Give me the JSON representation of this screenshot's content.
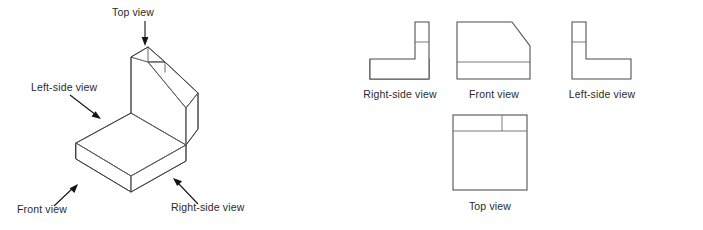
{
  "diagram": {
    "background_color": "#ffffff",
    "line_color": "#5a5a5a",
    "label_color": "#2a2a2a",
    "arrow_color": "#141414"
  },
  "isometric": {
    "caption_top": "Top view",
    "caption_left": "Left-side view",
    "caption_front": "Front view",
    "caption_right": "Right-side view",
    "object_description": "L-shaped bracket: horizontal base slab with an upright back plate whose upper right corner is chamfered"
  },
  "orthographic": {
    "views": [
      {
        "id": "right-side",
        "label": "Right-side view",
        "shape": "L-profile, upright leg at right, horizontal foot extending left, internal horizontal line near top of upright leg"
      },
      {
        "id": "front",
        "label": "Front view",
        "shape": "rectangle with chamfered upper-right corner and a horizontal line near the bottom"
      },
      {
        "id": "left-side",
        "label": "Left-side view",
        "shape": "mirrored L-profile, upright leg at left, horizontal foot extending right, internal horizontal line near top of upright leg"
      },
      {
        "id": "top",
        "label": "Top view",
        "shape": "rectangle with a horizontal band across the top that is split by a short vertical line"
      }
    ]
  }
}
